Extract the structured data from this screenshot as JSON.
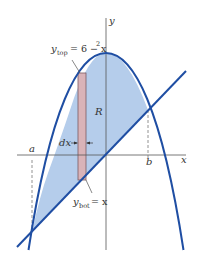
{
  "figure": {
    "axes": {
      "x_label": "x",
      "y_label": "y"
    },
    "curves": {
      "top": {
        "label_var": "y",
        "label_sub": "top",
        "label_rhs": "= 6 − x",
        "label_sup": "2"
      },
      "bottom": {
        "label_var": "y",
        "label_sub": "bot",
        "label_rhs": "= x"
      }
    },
    "region_label": "R",
    "strip_label": "dx",
    "bounds": {
      "left": "a",
      "right": "b"
    },
    "colors": {
      "curve": "#1f4ea3",
      "region_fill": "#b5cdeb",
      "strip_fill": "#d9b3b8",
      "strip_stroke": "#7a5a62",
      "axis": "#555555",
      "dashed": "#777777"
    }
  }
}
